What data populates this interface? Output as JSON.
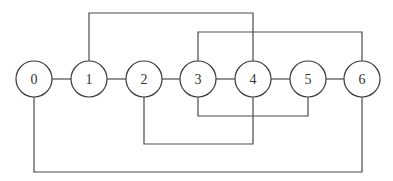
{
  "diagram": {
    "type": "graph",
    "nodes": [
      {
        "id": "0",
        "label": "0",
        "cx": 34,
        "cy": 79
      },
      {
        "id": "1",
        "label": "1",
        "cx": 89,
        "cy": 79
      },
      {
        "id": "2",
        "label": "2",
        "cx": 144,
        "cy": 79
      },
      {
        "id": "3",
        "label": "3",
        "cx": 198,
        "cy": 79
      },
      {
        "id": "4",
        "label": "4",
        "cx": 253,
        "cy": 79
      },
      {
        "id": "5",
        "label": "5",
        "cx": 308,
        "cy": 79
      },
      {
        "id": "6",
        "label": "6",
        "cx": 362,
        "cy": 79
      }
    ],
    "node_radius": 18,
    "edges": [
      {
        "from": "0",
        "to": "1",
        "route": "straight"
      },
      {
        "from": "1",
        "to": "2",
        "route": "straight"
      },
      {
        "from": "2",
        "to": "3",
        "route": "straight"
      },
      {
        "from": "3",
        "to": "4",
        "route": "straight"
      },
      {
        "from": "4",
        "to": "5",
        "route": "straight"
      },
      {
        "from": "5",
        "to": "6",
        "route": "straight"
      },
      {
        "from": "1",
        "to": "4",
        "route": "over",
        "y": 13
      },
      {
        "from": "3",
        "to": "6",
        "route": "over",
        "y": 32
      },
      {
        "from": "3",
        "to": "5",
        "route": "under",
        "y": 116
      },
      {
        "from": "2",
        "to": "4",
        "route": "under",
        "y": 144
      },
      {
        "from": "0",
        "to": "6",
        "route": "under",
        "y": 172
      }
    ],
    "colors": {
      "stroke": "#4a4a4a",
      "node_fill": "#ffffff",
      "label": "#333333"
    }
  }
}
